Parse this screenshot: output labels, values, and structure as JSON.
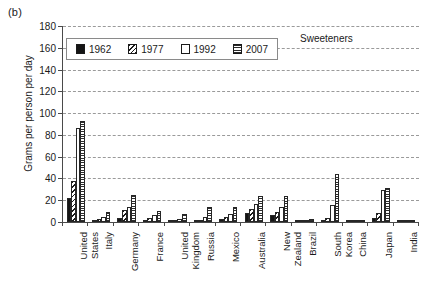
{
  "panel_label": "(b)",
  "axis": {
    "y_title": "Grams per person per day",
    "y_ticks": [
      0,
      20,
      40,
      60,
      80,
      100,
      120,
      140,
      160,
      180
    ],
    "y_min": 0,
    "y_max": 180
  },
  "legend": {
    "items": [
      {
        "label": "1962",
        "pattern": "solid-black"
      },
      {
        "label": "1977",
        "pattern": "diagonal-hatch"
      },
      {
        "label": "1992",
        "pattern": "white-empty"
      },
      {
        "label": "2007",
        "pattern": "horizontal-lines"
      }
    ]
  },
  "chart_data": {
    "type": "bar",
    "title": "Sweeteners",
    "xlabel": "",
    "ylabel": "Grams per person per day",
    "ylim": [
      0,
      180
    ],
    "grid": true,
    "legend_position": "top-left-inside",
    "categories": [
      "United States",
      "Italy",
      "Germany",
      "France",
      "United Kingdom",
      "Russia",
      "Mexico",
      "Australia",
      "New Zealand",
      "Brazil",
      "South Korea",
      "China",
      "Japan",
      "India"
    ],
    "series": [
      {
        "name": "1962",
        "pattern": "solid-black",
        "values": [
          22,
          2,
          4,
          2,
          2,
          1,
          3,
          8,
          6,
          1,
          1,
          1,
          4,
          1
        ]
      },
      {
        "name": "1977",
        "pattern": "diagonal-hatch",
        "values": [
          38,
          3,
          11,
          4,
          2,
          2,
          5,
          12,
          9,
          2,
          4,
          1,
          8,
          1
        ]
      },
      {
        "name": "1992",
        "pattern": "white-empty",
        "values": [
          86,
          5,
          14,
          6,
          3,
          5,
          7,
          17,
          14,
          2,
          16,
          1,
          29,
          1
        ]
      },
      {
        "name": "2007",
        "pattern": "horizontal-lines",
        "values": [
          93,
          9,
          25,
          10,
          7,
          14,
          14,
          24,
          24,
          3,
          44,
          2,
          31,
          1
        ]
      }
    ]
  }
}
